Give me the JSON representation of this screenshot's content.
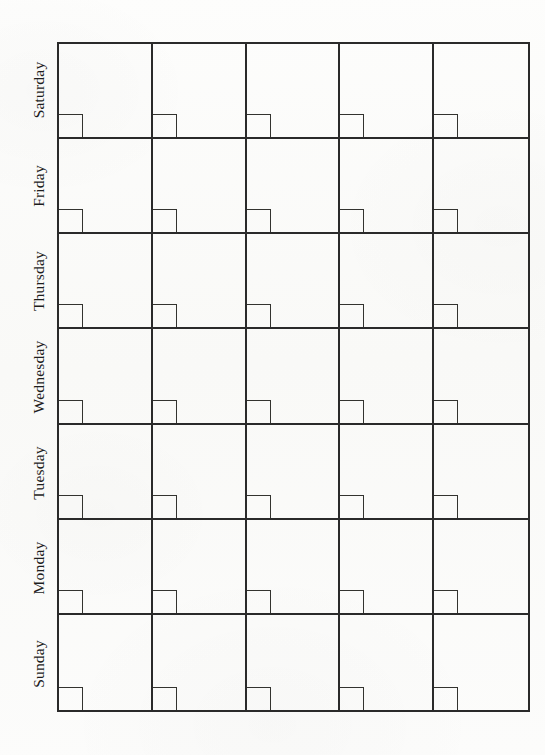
{
  "document": {
    "kind": "blank-weekly-calendar-grid",
    "orientation": "rows-are-weekdays",
    "background_color": "#fbfbfa",
    "ink_color": "#2a2a2a"
  },
  "grid": {
    "columns": 5,
    "rows": 7,
    "column_labels": [
      "",
      "",
      "",
      "",
      ""
    ],
    "row_labels": [
      "Saturday",
      "Friday",
      "Thursday",
      "Wednesday",
      "Tuesday",
      "Monday",
      "Sunday"
    ],
    "cells": [
      [
        "",
        "",
        "",
        "",
        ""
      ],
      [
        "",
        "",
        "",
        "",
        ""
      ],
      [
        "",
        "",
        "",
        "",
        ""
      ],
      [
        "",
        "",
        "",
        "",
        ""
      ],
      [
        "",
        "",
        "",
        "",
        ""
      ],
      [
        "",
        "",
        "",
        "",
        ""
      ],
      [
        "",
        "",
        "",
        "",
        ""
      ]
    ]
  }
}
